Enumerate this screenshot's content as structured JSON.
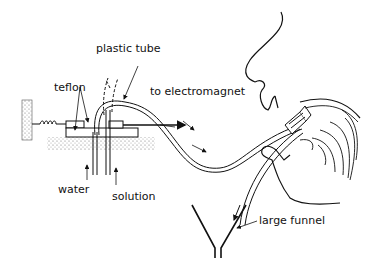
{
  "diagram": {
    "type": "apparatus-schematic",
    "labels": {
      "plastic_tube": "plastic tube",
      "teflon": "teflon",
      "to_electromagnet": "to electromagnet",
      "water": "water",
      "solution": "solution",
      "large_funnel": "large funnel"
    },
    "colors": {
      "ink": "#111111",
      "background": "#ffffff",
      "hatch": "#888888"
    }
  }
}
